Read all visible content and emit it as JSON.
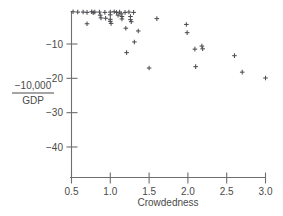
{
  "chart_data": {
    "type": "scatter",
    "title": "",
    "xlabel": "Crowdedness",
    "ylabel": "-10,000 / GDP",
    "ylabel_numerator": "−10,000",
    "ylabel_denominator": "GDP",
    "xlim": [
      0.42,
      3.06
    ],
    "ylim": [
      -46.5,
      0.8
    ],
    "grid": false,
    "legend": null,
    "marker": "plus",
    "marker_color": "#4d4d52",
    "xticks": [
      0.5,
      1.0,
      1.5,
      2.0,
      2.5,
      3.0
    ],
    "xtick_labels": [
      "0.5",
      "1.0",
      "1.5",
      "2.0",
      "2.5",
      "3.0"
    ],
    "yticks": [
      -10,
      -20,
      -30,
      -40
    ],
    "ytick_labels": [
      "−10",
      "−20",
      "−30",
      "−40"
    ],
    "points": [
      {
        "x": 0.52,
        "y": -0.6
      },
      {
        "x": 0.58,
        "y": -0.7
      },
      {
        "x": 0.65,
        "y": -0.7
      },
      {
        "x": 0.7,
        "y": -0.8
      },
      {
        "x": 0.7,
        "y": -4.1
      },
      {
        "x": 0.76,
        "y": -0.6
      },
      {
        "x": 0.78,
        "y": -0.9
      },
      {
        "x": 0.8,
        "y": -0.7
      },
      {
        "x": 0.86,
        "y": -0.7
      },
      {
        "x": 0.87,
        "y": -1.6
      },
      {
        "x": 0.88,
        "y": -2.4
      },
      {
        "x": 0.93,
        "y": -0.8
      },
      {
        "x": 0.94,
        "y": -2.5
      },
      {
        "x": 1.0,
        "y": -0.7
      },
      {
        "x": 1.0,
        "y": -1.5
      },
      {
        "x": 1.0,
        "y": -2.8
      },
      {
        "x": 1.0,
        "y": -3.4
      },
      {
        "x": 1.01,
        "y": -4.0
      },
      {
        "x": 1.05,
        "y": -0.6
      },
      {
        "x": 1.08,
        "y": -0.8
      },
      {
        "x": 1.1,
        "y": -1.6
      },
      {
        "x": 1.12,
        "y": -0.7
      },
      {
        "x": 1.14,
        "y": -1.2
      },
      {
        "x": 1.15,
        "y": -2.0
      },
      {
        "x": 1.15,
        "y": -2.7
      },
      {
        "x": 1.19,
        "y": -0.8
      },
      {
        "x": 1.2,
        "y": -5.4
      },
      {
        "x": 1.21,
        "y": -12.5
      },
      {
        "x": 1.24,
        "y": -0.7
      },
      {
        "x": 1.26,
        "y": -2.0
      },
      {
        "x": 1.26,
        "y": -2.9
      },
      {
        "x": 1.27,
        "y": -3.5
      },
      {
        "x": 1.3,
        "y": -0.8
      },
      {
        "x": 1.31,
        "y": -9.4
      },
      {
        "x": 1.36,
        "y": -6.2
      },
      {
        "x": 1.5,
        "y": -17.0
      },
      {
        "x": 1.6,
        "y": -2.6
      },
      {
        "x": 1.98,
        "y": -4.3
      },
      {
        "x": 1.99,
        "y": -6.7
      },
      {
        "x": 2.09,
        "y": -11.5
      },
      {
        "x": 2.1,
        "y": -16.6
      },
      {
        "x": 2.18,
        "y": -10.6
      },
      {
        "x": 2.19,
        "y": -11.4
      },
      {
        "x": 2.6,
        "y": -13.4
      },
      {
        "x": 2.7,
        "y": -18.2
      },
      {
        "x": 3.0,
        "y": -19.9
      }
    ]
  }
}
